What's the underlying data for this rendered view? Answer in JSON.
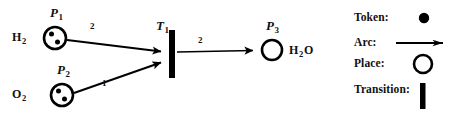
{
  "figure": {
    "kind": "petri-net",
    "background_color": "#ffffff",
    "ink_color": "#000000"
  },
  "net": {
    "places": [
      {
        "id": "P1",
        "label": "P",
        "subscript": "1",
        "chem_label": "H",
        "chem_subscript": "2",
        "chem_tail": "",
        "tokens": 2,
        "cx": 55,
        "cy": 38,
        "r": 11
      },
      {
        "id": "P2",
        "label": "P",
        "subscript": "2",
        "chem_label": "O",
        "chem_subscript": "2",
        "chem_tail": "",
        "tokens": 2,
        "cx": 62,
        "cy": 95,
        "r": 11
      },
      {
        "id": "P3",
        "label": "P",
        "subscript": "3",
        "chem_label": "H",
        "chem_subscript": "2",
        "chem_tail": "O",
        "tokens": 0,
        "cx": 272,
        "cy": 50,
        "r": 10
      }
    ],
    "transitions": [
      {
        "id": "T1",
        "label": "T",
        "subscript": "1",
        "x": 172,
        "y_top": 30,
        "y_bottom": 78,
        "width": 6
      }
    ],
    "arcs": [
      {
        "id": "arc-p1-t1",
        "from": "P1",
        "to": "T1",
        "weight": "2",
        "weight_x": 90,
        "weight_y": 27,
        "x1": 67,
        "y1": 40,
        "x2": 168,
        "y2": 52
      },
      {
        "id": "arc-p2-t1",
        "from": "P2",
        "to": "T1",
        "weight": "1",
        "weight_x": 102,
        "weight_y": 83,
        "x1": 74,
        "y1": 93,
        "x2": 168,
        "y2": 62
      },
      {
        "id": "arc-t1-p3",
        "from": "T1",
        "to": "P3",
        "weight": "2",
        "weight_x": 198,
        "weight_y": 41,
        "x1": 176,
        "y1": 52,
        "x2": 261,
        "y2": 50
      }
    ]
  },
  "legend": {
    "items": [
      {
        "key": "token",
        "label": "Token:",
        "symbol": "filled-circle"
      },
      {
        "key": "arc",
        "label": "Arc:",
        "symbol": "arrow"
      },
      {
        "key": "place",
        "label": "Place:",
        "symbol": "open-circle"
      },
      {
        "key": "transition",
        "label": "Transition:",
        "symbol": "vertical-bar"
      }
    ]
  }
}
